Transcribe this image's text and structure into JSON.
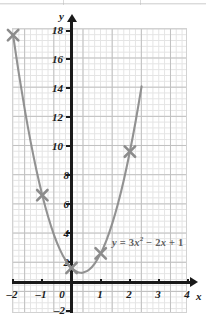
{
  "figure": {
    "kind": "coordinate-plane-graph",
    "equation_label": "y = 3x² − 2x + 1",
    "equation_parts": {
      "lhs": "y",
      "eq": " = ",
      "coef_a": "3",
      "var_sq": "x",
      "exp": "2",
      "minus": " − ",
      "coef_b": "2",
      "var_b": "x",
      "plus": " + ",
      "const": "1"
    },
    "x_axis_name": "x",
    "y_axis_name": "y",
    "colors": {
      "curve": "#8c8c8c",
      "marker": "#8c8c8c",
      "axis": "#1a1a1a",
      "grid_minor": "#e3e3e3",
      "grid_major": "#bdbdbd",
      "label": "#1a1a1a",
      "equation": "#5e5e5e"
    }
  },
  "chart_data": {
    "type": "line",
    "title": "",
    "subtitle": "",
    "xlabel": "x",
    "ylabel": "y",
    "annotations": [
      "y = 3x² − 2x + 1"
    ],
    "grid": true,
    "legend": "none",
    "xlim": [
      -2,
      4
    ],
    "ylim": [
      -2,
      18
    ],
    "xticks": [
      -2,
      -1,
      0,
      1,
      2,
      3,
      4
    ],
    "xtick_labels": [
      "–2",
      "–1",
      "0",
      "1",
      "2",
      "3",
      "4"
    ],
    "yticks": [
      -2,
      2,
      4,
      6,
      8,
      10,
      12,
      14,
      16,
      18
    ],
    "ytick_labels": [
      "–2",
      "2",
      "4",
      "6",
      "8",
      "10",
      "12",
      "14",
      "16",
      "18"
    ],
    "y_origin_label": "0",
    "minor_grid_step": 0.2,
    "major_grid_step": 1,
    "function": "y = 3x^2 - 2x + 1",
    "vertex": [
      0.333,
      0.667
    ],
    "marked_points": [
      {
        "x": -2,
        "y": 17,
        "label": "(–2, 17)"
      },
      {
        "x": -1,
        "y": 6,
        "label": "(–1, 6)"
      },
      {
        "x": 0,
        "y": 1,
        "label": "(0, 1)"
      },
      {
        "x": 1,
        "y": 2,
        "label": "(1, 2)"
      },
      {
        "x": 2,
        "y": 9,
        "label": "(2, 9)"
      }
    ],
    "series": [
      {
        "name": "y = 3x² − 2x + 1",
        "x": [
          -2.0,
          -1.8,
          -1.6,
          -1.4,
          -1.2,
          -1.0,
          -0.8,
          -0.6,
          -0.4,
          -0.2,
          0.0,
          0.2,
          0.3333,
          0.4,
          0.6,
          0.8,
          1.0,
          1.2,
          1.4,
          1.6,
          1.8,
          2.0,
          2.2,
          2.4
        ],
        "values": [
          17.0,
          14.32,
          11.88,
          9.68,
          7.72,
          6.0,
          4.52,
          3.28,
          2.28,
          1.52,
          1.0,
          0.72,
          0.6667,
          0.68,
          0.88,
          1.32,
          2.0,
          2.92,
          4.08,
          5.48,
          7.12,
          9.0,
          11.12,
          13.48
        ]
      }
    ]
  }
}
